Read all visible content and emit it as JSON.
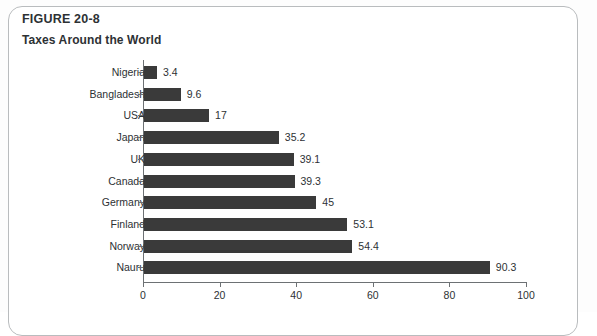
{
  "figure": {
    "number": "FIGURE 20-8",
    "title": "Taxes Around the World"
  },
  "colors": {
    "bar": "#3a3a3a",
    "axis": "#6d7174",
    "text": "#2d3134",
    "frame": "#b9bcbe",
    "background": "#ffffff"
  },
  "chart_data": {
    "type": "bar",
    "orientation": "horizontal",
    "title": "Taxes Around the World",
    "subtitle": "FIGURE 20-8",
    "xlabel": "",
    "ylabel": "",
    "xlim": [
      0,
      100
    ],
    "xticks": [
      0,
      20,
      40,
      60,
      80,
      100
    ],
    "xtick_labels": [
      "0",
      "20",
      "40",
      "60",
      "80",
      "100"
    ],
    "grid": false,
    "legend": false,
    "data_labels": true,
    "categories": [
      "Nigeria",
      "Bangladesh",
      "USA",
      "Japan",
      "UK",
      "Canada",
      "Germany",
      "Finland",
      "Norway",
      "Nauru"
    ],
    "values": [
      3.4,
      9.6,
      17,
      35.2,
      39.1,
      39.3,
      45,
      53.1,
      54.4,
      90.3
    ],
    "value_labels": [
      "3.4",
      "9.6",
      "17",
      "35.2",
      "39.1",
      "39.3",
      "45",
      "53.1",
      "54.4",
      "90.3"
    ]
  }
}
